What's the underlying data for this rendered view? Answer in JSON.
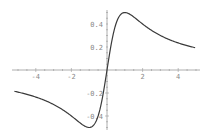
{
  "chart_data": {
    "type": "line",
    "title": "",
    "xlabel": "",
    "ylabel": "",
    "function_shape": "x/(1+x^2)",
    "xlim": [
      -5,
      5
    ],
    "ylim": [
      -0.5,
      0.5
    ],
    "grid": false,
    "legend": null,
    "x_ticks": [
      -4,
      -2,
      2,
      4
    ],
    "x_tick_labels": [
      "-4",
      "-2",
      "2",
      "4"
    ],
    "y_ticks": [
      0.4,
      0.2,
      -0.2,
      -0.4
    ],
    "y_tick_labels": [
      "0.4",
      "0.2",
      "-0.2",
      "-0.4"
    ],
    "series": [
      {
        "name": "curve",
        "x": [
          -5,
          -4.5,
          -4,
          -3.5,
          -3,
          -2.5,
          -2,
          -1.5,
          -1.25,
          -1,
          -0.75,
          -0.5,
          -0.25,
          0,
          0.25,
          0.5,
          0.75,
          1,
          1.25,
          1.5,
          2,
          2.5,
          3,
          3.5,
          4,
          4.5,
          5
        ],
        "y": [
          -0.192,
          -0.212,
          -0.235,
          -0.264,
          -0.3,
          -0.345,
          -0.4,
          -0.462,
          -0.488,
          -0.5,
          -0.48,
          -0.4,
          -0.235,
          0,
          0.235,
          0.4,
          0.48,
          0.5,
          0.488,
          0.462,
          0.4,
          0.345,
          0.3,
          0.264,
          0.235,
          0.212,
          0.192
        ]
      }
    ]
  },
  "colors": {
    "curve": "#3a3a3a",
    "axis": "#999999",
    "tick_label": "#888888",
    "background": "#ffffff"
  }
}
